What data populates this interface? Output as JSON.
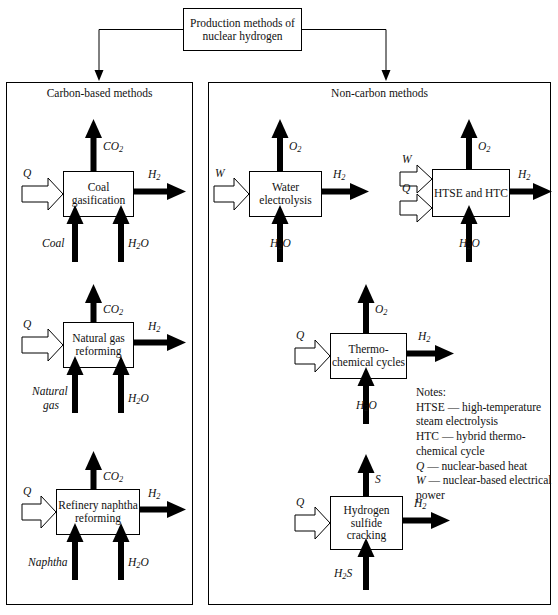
{
  "title_box": {
    "line1": "Production methods of",
    "line2": "nuclear hydrogen"
  },
  "panels": [
    {
      "id": "carbon",
      "title": "Carbon-based methods"
    },
    {
      "id": "noncarbon",
      "title": "Non-carbon methods"
    }
  ],
  "processes": [
    {
      "id": "coal-gasification",
      "line1": "Coal",
      "line2": "gasification",
      "line3": ""
    },
    {
      "id": "natural-gas-reforming",
      "line1": "Natural gas",
      "line2": "reforming",
      "line3": ""
    },
    {
      "id": "refinery-naphtha-reforming",
      "line1": "Refinery naphtha",
      "line2": "reforming",
      "line3": ""
    },
    {
      "id": "water-electrolysis",
      "line1": "Water",
      "line2": "electrolysis",
      "line3": ""
    },
    {
      "id": "htse-htc",
      "line1": "HTSE and HTC",
      "line2": "",
      "line3": ""
    },
    {
      "id": "thermochemical-cycles",
      "line1": "Thermo-",
      "line2": "chemical cycles",
      "line3": ""
    },
    {
      "id": "hydrogen-sulfide-cracking",
      "line1": "Hydrogen",
      "line2": "sulfide",
      "line3": "cracking"
    }
  ],
  "stream_labels": {
    "co2": "CO2",
    "h2": "H2",
    "o2": "O2",
    "h2o": "H2O",
    "h2s": "H2S",
    "s": "S",
    "coal": "Coal",
    "natural_gas_1": "Natural",
    "natural_gas_2": "gas",
    "naphtha": "Naphtha",
    "q": "Q",
    "w": "W"
  },
  "notes": {
    "heading": "Notes:",
    "lines": [
      "HTSE — high-temperature",
      "steam electrolysis",
      "HTC — hybrid thermo-",
      "chemical cycle",
      "Q — nuclear-based heat",
      "W — nuclear-based electrical",
      "power"
    ]
  },
  "colors": {
    "stroke": "#000000",
    "background": "#ffffff"
  }
}
